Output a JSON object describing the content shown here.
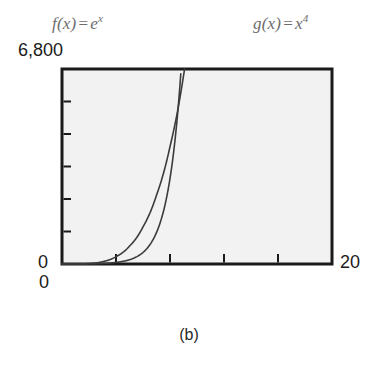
{
  "figure": {
    "caption": "(b)",
    "background_color": "#ffffff",
    "plot_background_color": "#f2f2f2",
    "frame_color": "#1a1a1a"
  },
  "legend": {
    "entries": [
      {
        "name": "f-of-x",
        "func_name": "f",
        "arg_open": "(",
        "arg": "x",
        "arg_close": ")",
        "equals": "=",
        "base": "e",
        "exponent": "x",
        "full": "f(x) = e^x",
        "color": "#6d6d6d"
      },
      {
        "name": "g-of-x",
        "func_name": "g",
        "arg_open": "(",
        "arg": "x",
        "arg_close": ")",
        "equals": "=",
        "base": "x",
        "exponent": "4",
        "full": "g(x) = x^4",
        "color": "#6d6d6d"
      }
    ]
  },
  "axes": {
    "y_max_label": "6,800",
    "y_min_label": "0",
    "x_min_label": "0",
    "x_max_label": "20",
    "x_tick_count": 5,
    "y_tick_count": 6
  },
  "chart_data": {
    "type": "line",
    "title": "",
    "subtitle": "",
    "caption": "(b)",
    "xlabel": "",
    "ylabel": "",
    "xlim": [
      0,
      20
    ],
    "ylim": [
      0,
      6800
    ],
    "xticks": [
      0,
      4,
      8,
      12,
      16,
      20
    ],
    "yticks": [
      0,
      1133,
      2267,
      3400,
      4533,
      5667,
      6800
    ],
    "xtick_labels": [
      "0",
      "",
      "",
      "",
      "",
      "20"
    ],
    "ytick_labels": [
      "0",
      "",
      "",
      "",
      "",
      "",
      "6,800"
    ],
    "grid": false,
    "legend_position": "above-plot",
    "series": [
      {
        "name": "f(x) = e^x",
        "color": "#3b3b3b",
        "linewidth": 1.6,
        "x": [
          0,
          1,
          2,
          3,
          4,
          5,
          6,
          7,
          8,
          8.5,
          8.8
        ],
        "values": [
          1,
          2.72,
          7.39,
          20.1,
          54.6,
          148.4,
          403.4,
          1096.6,
          2981,
          4915,
          6634
        ]
      },
      {
        "name": "g(x) = x^4",
        "color": "#3b3b3b",
        "linewidth": 1.6,
        "x": [
          0,
          1,
          2,
          3,
          4,
          5,
          6,
          7,
          8,
          9,
          9.08
        ],
        "values": [
          0,
          1,
          16,
          81,
          256,
          625,
          1296,
          2401,
          4096,
          6561,
          6800
        ]
      }
    ],
    "annotations": [
      {
        "text": "f(x) = e^x",
        "position": "top-left"
      },
      {
        "text": "g(x) = x^4",
        "position": "top-right"
      }
    ]
  }
}
